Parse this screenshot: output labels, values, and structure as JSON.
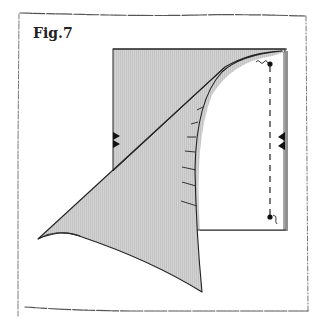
{
  "figure": {
    "label": "Fig.7"
  },
  "colors": {
    "paper_fill": "#cfcfcf",
    "flap_fill": "#c8c8c8",
    "stroke": "#222222",
    "frame": "#555555",
    "background": "#ffffff"
  },
  "diagram": {
    "elements": [
      "sketchy-border-frame",
      "square-sheet",
      "curved-folded-flap",
      "diagonal-crease",
      "left-arrow-markers",
      "right-arrow-markers",
      "dashed-fold-line",
      "top-dot-with-squiggle",
      "bottom-dot-with-squiggle",
      "curve-tick-marks"
    ]
  }
}
